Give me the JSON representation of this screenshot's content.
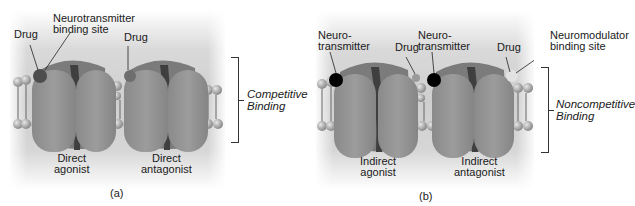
{
  "figure": {
    "panel_a": {
      "caption": "(a)",
      "labels": {
        "drug_left": "Drug",
        "nt_binding_site": "Neurotransmitter\nbinding site",
        "drug_right": "Drug",
        "direct_agonist": "Direct\nagonist",
        "direct_antagonist": "Direct\nantagonist"
      },
      "bracket_label": "Competitive\nBinding"
    },
    "panel_b": {
      "caption": "(b)",
      "labels": {
        "nt_left": "Neuro-\ntransmitter",
        "drug_left": "Drug",
        "nt_right": "Neuro-\ntransmitter",
        "drug_right": "Drug",
        "neuromodulator_site": "Neuromodulator\nbinding site",
        "indirect_agonist": "Indirect\nagonist",
        "indirect_antagonist": "Indirect\nantagonist"
      },
      "bracket_label": "Noncompetitive\nBinding"
    },
    "colors": {
      "membrane_bg": "#d0d0d0",
      "receptor": "#8f8f8f",
      "receptor_dark": "#4a4a4a",
      "lipid_head": "#a8a8a8",
      "drug_agonist": "#4d4d4d",
      "drug_antagonist": "#6e6e6e",
      "neurotransmitter": "#000000",
      "neuromodulator_drug": "#e2e2e2"
    }
  }
}
